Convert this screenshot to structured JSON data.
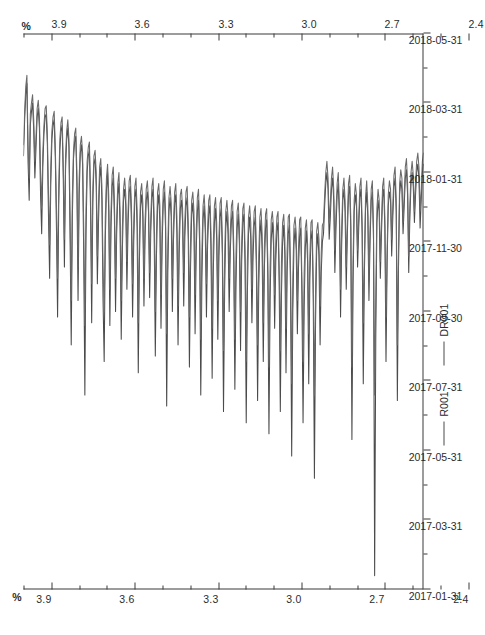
{
  "chart_data": {
    "type": "line",
    "title": "",
    "xlabel": "",
    "ylabel": "%",
    "unit_label": "%",
    "ylim": [
      2.0,
      4.0
    ],
    "y_major_ticks": [
      "3.9",
      "3.6",
      "3.3",
      "3.0",
      "2.7",
      "2.4",
      "2.1"
    ],
    "y_major_values": [
      3.9,
      3.6,
      3.3,
      3.0,
      2.7,
      2.4,
      2.1
    ],
    "y_minor_step": 0.1,
    "grid": false,
    "legend_position": "bottom",
    "axis_duplicated_top_and_bottom": true,
    "x_tick_labels": [
      "2017-01-31",
      "2017-03-31",
      "2017-05-31",
      "2017-07-31",
      "2017-09-30",
      "2017-11-30",
      "2018-01-31",
      "2018-03-31",
      "2018-05-31"
    ],
    "x_minor_ticks_per_major": 2,
    "series": [
      {
        "name": "R001",
        "color": "#4b4b4b",
        "values": [
          2.44,
          2.31,
          2.22,
          2.18,
          2.46,
          2.6,
          2.33,
          2.28,
          2.25,
          2.35,
          2.52,
          2.41,
          2.3,
          2.27,
          2.34,
          2.58,
          2.72,
          2.48,
          2.36,
          2.3,
          2.29,
          2.4,
          2.66,
          2.88,
          2.54,
          2.38,
          2.33,
          2.31,
          2.45,
          2.7,
          3.02,
          2.62,
          2.42,
          2.35,
          2.33,
          2.52,
          2.84,
          2.49,
          2.38,
          2.34,
          2.41,
          2.74,
          3.12,
          2.66,
          2.45,
          2.39,
          2.37,
          2.55,
          2.96,
          2.58,
          2.43,
          2.4,
          2.47,
          2.8,
          3.3,
          2.72,
          2.5,
          2.44,
          2.42,
          2.63,
          3.04,
          2.61,
          2.47,
          2.45,
          2.55,
          2.9,
          2.68,
          2.52,
          2.48,
          2.6,
          2.96,
          3.18,
          2.74,
          2.56,
          2.5,
          2.64,
          3.05,
          2.7,
          2.55,
          2.52,
          2.66,
          3.0,
          2.72,
          2.58,
          2.54,
          2.7,
          3.1,
          2.78,
          2.6,
          2.56,
          2.62,
          2.92,
          2.69,
          2.57,
          2.55,
          2.68,
          3.02,
          2.75,
          2.59,
          2.56,
          2.7,
          3.22,
          2.82,
          2.62,
          2.58,
          2.66,
          2.98,
          2.73,
          2.6,
          2.57,
          2.64,
          2.95,
          2.71,
          2.59,
          2.56,
          2.72,
          3.16,
          2.8,
          2.62,
          2.58,
          2.68,
          3.06,
          2.76,
          2.61,
          2.57,
          2.7,
          3.34,
          2.86,
          2.64,
          2.59,
          2.66,
          3.0,
          2.74,
          2.61,
          2.58,
          2.72,
          3.12,
          2.79,
          2.63,
          2.6,
          2.68,
          2.98,
          2.73,
          2.62,
          2.59,
          2.74,
          3.2,
          2.84,
          2.65,
          2.61,
          2.7,
          3.08,
          2.78,
          2.64,
          2.6,
          2.76,
          3.3,
          2.88,
          2.67,
          2.62,
          2.72,
          3.02,
          2.76,
          2.65,
          2.62,
          2.78,
          3.24,
          2.86,
          2.68,
          2.63,
          2.74,
          3.1,
          2.8,
          2.66,
          2.63,
          2.8,
          3.36,
          2.92,
          2.7,
          2.64,
          2.72,
          3.0,
          2.78,
          2.67,
          2.64,
          2.82,
          3.28,
          2.9,
          2.7,
          2.65,
          2.76,
          3.14,
          2.82,
          2.68,
          2.65,
          2.84,
          3.4,
          2.94,
          2.72,
          2.66,
          2.74,
          3.04,
          2.8,
          2.69,
          2.66,
          2.86,
          3.32,
          2.92,
          2.73,
          2.67,
          2.78,
          3.18,
          2.84,
          2.7,
          2.67,
          2.88,
          3.44,
          2.96,
          2.74,
          2.68,
          2.76,
          3.06,
          2.82,
          2.71,
          2.68,
          2.9,
          3.36,
          2.94,
          2.75,
          2.69,
          2.8,
          3.22,
          2.86,
          2.72,
          2.69,
          2.92,
          3.52,
          3.0,
          2.76,
          2.7,
          2.78,
          3.08,
          2.84,
          2.73,
          2.7,
          2.94,
          3.4,
          2.98,
          2.77,
          2.71,
          2.82,
          3.26,
          2.88,
          2.74,
          2.71,
          2.96,
          3.6,
          3.04,
          2.78,
          2.72,
          2.8,
          3.12,
          2.86,
          2.75,
          2.72,
          2.62,
          2.54,
          2.5,
          2.56,
          2.74,
          2.66,
          2.56,
          2.52,
          2.6,
          2.86,
          2.7,
          2.58,
          2.54,
          2.66,
          3.02,
          2.76,
          2.6,
          2.56,
          2.64,
          2.92,
          2.72,
          2.58,
          2.55,
          2.7,
          3.46,
          2.9,
          2.64,
          2.58,
          2.62,
          2.84,
          2.7,
          2.59,
          2.56,
          2.72,
          3.26,
          2.86,
          2.63,
          2.57,
          2.66,
          2.96,
          2.74,
          2.6,
          2.57,
          2.74,
          3.95,
          3.1,
          2.68,
          2.6,
          2.64,
          2.88,
          2.72,
          2.59,
          2.56,
          2.7,
          3.18,
          2.82,
          2.62,
          2.57,
          2.6,
          2.8,
          2.66,
          2.55,
          2.52,
          2.64,
          3.32,
          2.84,
          2.58,
          2.53,
          2.56,
          2.72,
          2.62,
          2.52,
          2.49,
          2.58,
          2.86,
          2.66,
          2.54,
          2.5,
          2.55,
          2.68,
          2.58,
          2.5,
          2.47,
          2.52,
          2.7,
          2.6,
          2.5,
          2.47
        ]
      },
      {
        "name": "DR001",
        "color": "#6a6a6a",
        "values": [
          2.4,
          2.28,
          2.19,
          2.15,
          2.4,
          2.52,
          2.29,
          2.25,
          2.22,
          2.31,
          2.46,
          2.37,
          2.27,
          2.24,
          2.3,
          2.5,
          2.62,
          2.43,
          2.33,
          2.27,
          2.26,
          2.36,
          2.58,
          2.76,
          2.48,
          2.35,
          2.3,
          2.28,
          2.41,
          2.62,
          2.88,
          2.55,
          2.38,
          2.32,
          2.3,
          2.47,
          2.74,
          2.44,
          2.35,
          2.31,
          2.38,
          2.65,
          2.96,
          2.58,
          2.42,
          2.36,
          2.34,
          2.5,
          2.84,
          2.52,
          2.4,
          2.37,
          2.43,
          2.7,
          3.05,
          2.63,
          2.46,
          2.41,
          2.39,
          2.57,
          2.9,
          2.56,
          2.44,
          2.42,
          2.5,
          2.8,
          2.61,
          2.48,
          2.45,
          2.55,
          2.84,
          3.0,
          2.66,
          2.52,
          2.47,
          2.58,
          2.92,
          2.64,
          2.51,
          2.48,
          2.6,
          2.88,
          2.66,
          2.54,
          2.5,
          2.64,
          2.96,
          2.7,
          2.56,
          2.52,
          2.58,
          2.82,
          2.64,
          2.53,
          2.51,
          2.62,
          2.9,
          2.68,
          2.55,
          2.52,
          2.64,
          3.04,
          2.73,
          2.57,
          2.54,
          2.61,
          2.88,
          2.67,
          2.56,
          2.53,
          2.6,
          2.86,
          2.66,
          2.55,
          2.52,
          2.66,
          3.0,
          2.72,
          2.57,
          2.54,
          2.62,
          2.94,
          2.7,
          2.56,
          2.53,
          2.64,
          3.08,
          2.76,
          2.59,
          2.55,
          2.61,
          2.88,
          2.68,
          2.57,
          2.54,
          2.66,
          2.98,
          2.72,
          2.58,
          2.56,
          2.63,
          2.86,
          2.67,
          2.57,
          2.55,
          2.68,
          3.02,
          2.74,
          2.6,
          2.57,
          2.64,
          2.94,
          2.71,
          2.59,
          2.56,
          2.7,
          3.1,
          2.78,
          2.62,
          2.58,
          2.66,
          2.9,
          2.7,
          2.6,
          2.58,
          2.72,
          3.06,
          2.76,
          2.62,
          2.59,
          2.68,
          2.96,
          2.73,
          2.61,
          2.59,
          2.74,
          3.14,
          2.8,
          2.64,
          2.6,
          2.66,
          2.88,
          2.71,
          2.62,
          2.6,
          2.76,
          3.1,
          2.79,
          2.64,
          2.61,
          2.7,
          3.0,
          2.75,
          2.63,
          2.61,
          2.78,
          3.18,
          2.82,
          2.66,
          2.62,
          2.68,
          2.92,
          2.73,
          2.64,
          2.62,
          2.8,
          3.12,
          2.8,
          2.66,
          2.63,
          2.72,
          3.04,
          2.76,
          2.65,
          2.63,
          2.82,
          3.2,
          2.84,
          2.67,
          2.64,
          2.7,
          2.94,
          2.75,
          2.66,
          2.64,
          2.84,
          3.14,
          2.82,
          2.68,
          2.65,
          2.74,
          3.06,
          2.78,
          2.66,
          2.65,
          2.86,
          3.26,
          2.88,
          2.69,
          2.66,
          2.72,
          2.96,
          2.77,
          2.67,
          2.66,
          2.88,
          3.18,
          2.86,
          2.7,
          2.67,
          2.76,
          3.08,
          2.8,
          2.68,
          2.67,
          2.9,
          3.3,
          2.92,
          2.71,
          2.68,
          2.74,
          2.98,
          2.79,
          2.69,
          2.68,
          2.58,
          2.5,
          2.46,
          2.52,
          2.68,
          2.61,
          2.52,
          2.48,
          2.56,
          2.78,
          2.64,
          2.54,
          2.5,
          2.62,
          2.92,
          2.7,
          2.56,
          2.52,
          2.6,
          2.84,
          2.67,
          2.54,
          2.51,
          2.66,
          3.2,
          2.82,
          2.6,
          2.54,
          2.58,
          2.78,
          2.66,
          2.55,
          2.52,
          2.68,
          3.04,
          2.8,
          2.59,
          2.53,
          2.62,
          2.88,
          2.7,
          2.56,
          2.53,
          2.7,
          3.3,
          2.94,
          2.63,
          2.56,
          2.6,
          2.82,
          2.68,
          2.55,
          2.52,
          2.66,
          3.02,
          2.78,
          2.58,
          2.53,
          2.56,
          2.74,
          2.62,
          2.51,
          2.48,
          2.6,
          3.12,
          2.78,
          2.54,
          2.49,
          2.52,
          2.68,
          2.58,
          2.48,
          2.45,
          2.54,
          2.8,
          2.62,
          2.5,
          2.46,
          2.51,
          2.64,
          2.54,
          2.46,
          2.43,
          2.48,
          2.64,
          2.56,
          2.46,
          2.43
        ]
      }
    ]
  },
  "legend": {
    "items": [
      {
        "label": "R001"
      },
      {
        "label": "DR001"
      }
    ]
  },
  "axes": {
    "unit_top": "%",
    "unit_bottom": "%"
  }
}
